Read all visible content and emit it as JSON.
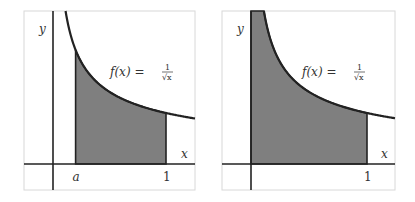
{
  "chart_data": [
    {
      "type": "area",
      "title": "",
      "function": "f(x) = 1/sqrt(x)",
      "function_label": {
        "lhs": "f(x) =",
        "num": "1",
        "den": "√x"
      },
      "xlabel": "x",
      "ylabel": "y",
      "x_ticks": [
        {
          "value": 0.2,
          "label": "a"
        },
        {
          "value": 1,
          "label": "1"
        }
      ],
      "shaded_interval": {
        "from_label": "a",
        "from": 0.2,
        "to": 1
      },
      "xlim": [
        -0.26,
        1.26
      ],
      "ylim": [
        -0.5,
        3.0
      ]
    },
    {
      "type": "area",
      "title": "",
      "function": "f(x) = 1/sqrt(x)",
      "function_label": {
        "lhs": "f(x) =",
        "num": "1",
        "den": "√x"
      },
      "xlabel": "x",
      "ylabel": "y",
      "x_ticks": [
        {
          "value": 1,
          "label": "1"
        }
      ],
      "shaded_interval": {
        "from_label": "0",
        "from": 0,
        "to": 1
      },
      "xlim": [
        -0.26,
        1.26
      ],
      "ylim": [
        -0.5,
        3.0
      ]
    }
  ]
}
